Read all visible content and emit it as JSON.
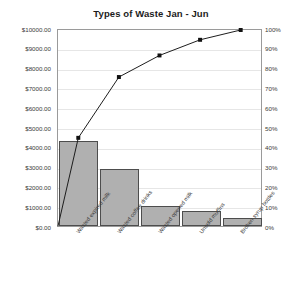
{
  "chart_data": {
    "type": "bar",
    "title": "Types of Waste Jan - Jun",
    "xlabel": "",
    "ylabel": "",
    "categories": [
      "Wasted expired milk",
      "Wasted coffee drinks",
      "Wasted opened milk",
      "Unsold muffins",
      "Broken syrup bottles"
    ],
    "series": [
      {
        "name": "Cost of waste",
        "type": "bar",
        "axis": "left",
        "values": [
          4300,
          2900,
          1000,
          750,
          400
        ]
      },
      {
        "name": "Cumulative percentage",
        "type": "line",
        "axis": "right",
        "values": [
          45,
          76,
          87,
          95,
          100
        ]
      }
    ],
    "ylim": [
      0,
      10000
    ],
    "y2lim": [
      0,
      100
    ],
    "ytick_labels": [
      "$10000.00",
      "$9000.00",
      "$8000.00",
      "$7000.00",
      "$6000.00",
      "$5000.00",
      "$4000.00",
      "$3000.00",
      "$2000.00",
      "$1000.00",
      "$0.00"
    ],
    "ytick_values": [
      10000,
      9000,
      8000,
      7000,
      6000,
      5000,
      4000,
      3000,
      2000,
      1000,
      0
    ],
    "y2tick_labels": [
      "100%",
      "90%",
      "80%",
      "70%",
      "60%",
      "50%",
      "40%",
      "30%",
      "20%",
      "10%",
      "0%"
    ],
    "y2tick_values": [
      100,
      90,
      80,
      70,
      60,
      50,
      40,
      30,
      20,
      10,
      0
    ],
    "grid": true,
    "legend": "none",
    "colors": {
      "bar_fill": "#b0b0b0",
      "bar_stroke": "#4d4d4d",
      "line": "#1a1a1a",
      "marker": "#111111",
      "grid": "#e6e6e6",
      "axis": "#9a9a9a",
      "text": "#3a3a3a",
      "title": "#1c1c1c"
    }
  }
}
